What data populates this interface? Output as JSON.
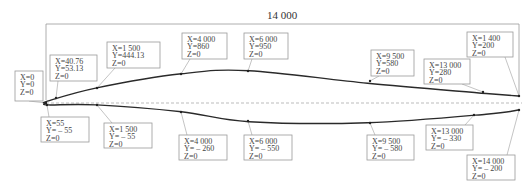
{
  "dimension": {
    "label": "14 000"
  },
  "colors": {
    "curve": "#2a2a2a",
    "leader": "#aaaaaa",
    "box": "#999999",
    "centerline": "#aaaaaa",
    "text": "#444444"
  },
  "profile": {
    "upper": [
      [
        0,
        0
      ],
      [
        40.76,
        53.13
      ],
      [
        1500,
        444.13
      ],
      [
        4000,
        860
      ],
      [
        6000,
        950
      ],
      [
        9500,
        580
      ],
      [
        13000,
        280
      ],
      [
        14000,
        200
      ]
    ],
    "lower": [
      [
        0,
        0
      ],
      [
        55,
        -55
      ],
      [
        1500,
        -55
      ],
      [
        4000,
        -260
      ],
      [
        6000,
        -550
      ],
      [
        9500,
        -580
      ],
      [
        13000,
        -330
      ],
      [
        14000,
        -200
      ]
    ]
  },
  "labels": [
    {
      "id": "origin",
      "lines": [
        "X=0",
        "Y=0",
        "Z=0"
      ]
    },
    {
      "id": "u-40",
      "lines": [
        "X=40.76",
        "Y=53.13",
        "Z=0"
      ]
    },
    {
      "id": "u-1500",
      "lines": [
        "X=1 500",
        "Y=444.13",
        "Z=0"
      ]
    },
    {
      "id": "u-4000",
      "lines": [
        "X=4 000",
        "Y=860",
        "Z=0"
      ]
    },
    {
      "id": "u-6000",
      "lines": [
        "X=6 000",
        "Y=950",
        "Z=0"
      ]
    },
    {
      "id": "u-9500",
      "lines": [
        "X=9 500",
        "Y=580",
        "Z=0"
      ]
    },
    {
      "id": "u-13000",
      "lines": [
        "X=13 000",
        "Y=280",
        "Z=0"
      ]
    },
    {
      "id": "u-14000",
      "lines": [
        "X=1 400",
        "Y=200",
        "Z=0"
      ]
    },
    {
      "id": "l-55",
      "lines": [
        "X=55",
        "Y= – 55",
        "Z=0"
      ]
    },
    {
      "id": "l-1500",
      "lines": [
        "X=1 500",
        "Y= – 55",
        "Z=0"
      ]
    },
    {
      "id": "l-4000",
      "lines": [
        "X=4 000",
        "Y= – 260",
        "Z=0"
      ]
    },
    {
      "id": "l-6000",
      "lines": [
        "X=6 000",
        "Y= – 550",
        "Z=0"
      ]
    },
    {
      "id": "l-9500",
      "lines": [
        "X=9 500",
        "Y= – 580",
        "Z=0"
      ]
    },
    {
      "id": "l-13000",
      "lines": [
        "X=13 000",
        "Y= – 330",
        "Z=0"
      ]
    },
    {
      "id": "l-14000",
      "lines": [
        "X=14 000",
        "Y= – 200",
        "Z=0"
      ]
    }
  ]
}
